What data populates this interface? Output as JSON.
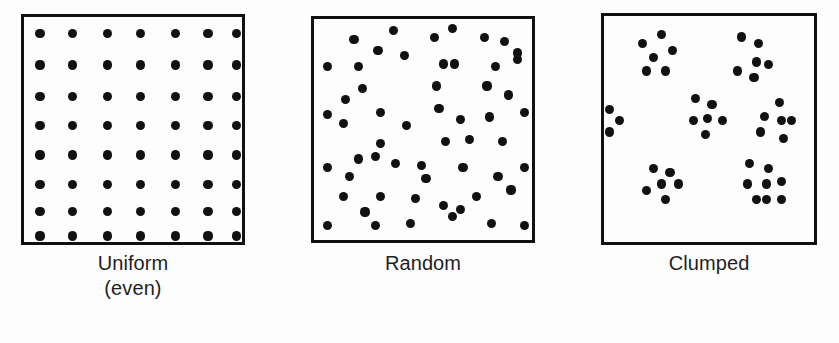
{
  "figure": {
    "background_color": "#fdfdfd",
    "ink_color": "#111111",
    "width": 839,
    "height": 343
  },
  "panels": [
    {
      "id": "uniform",
      "caption_lines": [
        "Uniform",
        "(even)"
      ],
      "box": {
        "x": 21,
        "y": 14,
        "w": 224,
        "h": 231
      },
      "caption_y": 251,
      "dot_radius": 4.6,
      "pattern": "uniform-grid",
      "grid": {
        "cols": 7,
        "rows": 8
      },
      "dot_count": 56
    },
    {
      "id": "random",
      "caption_lines": [
        "Random"
      ],
      "box": {
        "x": 311,
        "y": 16,
        "w": 224,
        "h": 227
      },
      "caption_y": 251,
      "dot_radius": 4.6,
      "pattern": "random-scatter",
      "dot_count": 56
    },
    {
      "id": "clumped",
      "caption_lines": [
        "Clumped"
      ],
      "box": {
        "x": 601,
        "y": 13,
        "w": 216,
        "h": 232
      },
      "caption_y": 251,
      "dot_radius": 4.6,
      "pattern": "clumped-clusters",
      "cluster_count": 6,
      "dot_count": 42
    }
  ],
  "chart_data": {
    "type": "scatter",
    "xlabel": "",
    "ylabel": "",
    "grid": false,
    "legend_position": "none",
    "xlim": [
      0,
      100
    ],
    "ylim": [
      0,
      100
    ],
    "note": "Three square plots showing uniform (even), random, and clumped spatial dispersion of individuals. Coordinates are percentages of each plot box.",
    "series": [
      {
        "name": "Uniform (even)",
        "panel": "uniform",
        "marker": "filled-circle",
        "color": "#111111",
        "points": [
          [
            6,
            6
          ],
          [
            21,
            6
          ],
          [
            37,
            6
          ],
          [
            52,
            6
          ],
          [
            68,
            6
          ],
          [
            83,
            6
          ],
          [
            96,
            6
          ],
          [
            6,
            20
          ],
          [
            21,
            20
          ],
          [
            37,
            20
          ],
          [
            52,
            20
          ],
          [
            68,
            20
          ],
          [
            83,
            20
          ],
          [
            96,
            20
          ],
          [
            6,
            34
          ],
          [
            21,
            34
          ],
          [
            37,
            34
          ],
          [
            52,
            34
          ],
          [
            68,
            34
          ],
          [
            83,
            34
          ],
          [
            96,
            34
          ],
          [
            6,
            47
          ],
          [
            21,
            47
          ],
          [
            37,
            47
          ],
          [
            52,
            47
          ],
          [
            68,
            47
          ],
          [
            83,
            47
          ],
          [
            96,
            47
          ],
          [
            6,
            60
          ],
          [
            21,
            60
          ],
          [
            37,
            60
          ],
          [
            52,
            60
          ],
          [
            68,
            60
          ],
          [
            83,
            60
          ],
          [
            96,
            60
          ],
          [
            6,
            73
          ],
          [
            21,
            73
          ],
          [
            37,
            73
          ],
          [
            52,
            73
          ],
          [
            68,
            73
          ],
          [
            83,
            73
          ],
          [
            96,
            73
          ],
          [
            6,
            85
          ],
          [
            21,
            85
          ],
          [
            37,
            85
          ],
          [
            52,
            85
          ],
          [
            68,
            85
          ],
          [
            83,
            85
          ],
          [
            96,
            85
          ],
          [
            6,
            96
          ],
          [
            21,
            96
          ],
          [
            37,
            96
          ],
          [
            52,
            96
          ],
          [
            68,
            96
          ],
          [
            83,
            96
          ],
          [
            96,
            96
          ]
        ]
      },
      {
        "name": "Random",
        "panel": "random",
        "marker": "filled-circle",
        "color": "#111111",
        "points": [
          [
            17,
            8
          ],
          [
            35,
            4
          ],
          [
            54,
            7
          ],
          [
            62,
            3
          ],
          [
            77,
            7
          ],
          [
            86,
            9
          ],
          [
            5,
            20
          ],
          [
            19,
            20
          ],
          [
            40,
            15
          ],
          [
            58,
            19
          ],
          [
            63,
            19
          ],
          [
            82,
            20
          ],
          [
            92,
            17
          ],
          [
            92,
            14
          ],
          [
            28,
            13
          ],
          [
            21,
            30
          ],
          [
            13,
            35
          ],
          [
            55,
            29
          ],
          [
            78,
            29
          ],
          [
            88,
            33
          ],
          [
            5,
            42
          ],
          [
            12,
            46
          ],
          [
            29,
            41
          ],
          [
            56,
            39
          ],
          [
            66,
            44
          ],
          [
            79,
            43
          ],
          [
            95,
            41
          ],
          [
            41,
            47
          ],
          [
            29,
            55
          ],
          [
            19,
            62
          ],
          [
            27,
            61
          ],
          [
            59,
            54
          ],
          [
            70,
            53
          ],
          [
            85,
            54
          ],
          [
            5,
            66
          ],
          [
            15,
            70
          ],
          [
            36,
            64
          ],
          [
            48,
            65
          ],
          [
            67,
            66
          ],
          [
            95,
            66
          ],
          [
            83,
            70
          ],
          [
            12,
            79
          ],
          [
            29,
            79
          ],
          [
            45,
            80
          ],
          [
            58,
            83
          ],
          [
            73,
            79
          ],
          [
            89,
            76
          ],
          [
            22,
            86
          ],
          [
            5,
            92
          ],
          [
            27,
            92
          ],
          [
            43,
            91
          ],
          [
            62,
            88
          ],
          [
            80,
            91
          ],
          [
            95,
            92
          ],
          [
            50,
            71
          ],
          [
            66,
            85
          ]
        ]
      },
      {
        "name": "Clumped",
        "panel": "clumped",
        "marker": "filled-circle",
        "color": "#111111",
        "clusters": [
          {
            "name": "top-left",
            "points": [
              [
                17,
                11
              ],
              [
                26,
                7
              ],
              [
                22,
                17
              ],
              [
                31,
                14
              ],
              [
                19,
                23
              ],
              [
                28,
                23
              ]
            ]
          },
          {
            "name": "top-right",
            "points": [
              [
                64,
                8
              ],
              [
                72,
                11
              ],
              [
                71,
                19
              ],
              [
                77,
                20
              ],
              [
                62,
                23
              ],
              [
                70,
                26
              ]
            ]
          },
          {
            "name": "left-edge",
            "points": [
              [
                1,
                40
              ],
              [
                6,
                45
              ],
              [
                1,
                50
              ]
            ]
          },
          {
            "name": "center",
            "points": [
              [
                42,
                35
              ],
              [
                50,
                38
              ],
              [
                41,
                45
              ],
              [
                48,
                44
              ],
              [
                55,
                45
              ],
              [
                47,
                51
              ]
            ]
          },
          {
            "name": "mid-right",
            "points": [
              [
                82,
                37
              ],
              [
                75,
                43
              ],
              [
                83,
                45
              ],
              [
                88,
                45
              ],
              [
                73,
                50
              ],
              [
                84,
                53
              ]
            ]
          },
          {
            "name": "bottom-left",
            "points": [
              [
                22,
                66
              ],
              [
                30,
                68
              ],
              [
                26,
                73
              ],
              [
                19,
                76
              ],
              [
                34,
                73
              ],
              [
                28,
                80
              ]
            ]
          },
          {
            "name": "bottom-right",
            "points": [
              [
                68,
                64
              ],
              [
                77,
                66
              ],
              [
                76,
                73
              ],
              [
                83,
                72
              ],
              [
                67,
                73
              ],
              [
                76,
                80
              ],
              [
                83,
                80
              ],
              [
                71,
                80
              ]
            ]
          }
        ]
      }
    ]
  }
}
